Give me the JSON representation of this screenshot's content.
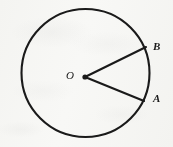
{
  "figure": {
    "kind": "geometry-diagram",
    "background_color": "#fbfbfa",
    "ink_color": "#1a1a1a",
    "canvas": {
      "width": 173,
      "height": 147
    },
    "circle": {
      "name": "main-circle",
      "center_x": 85.5,
      "center_y": 73,
      "radius": 64,
      "stroke_width": 2.1,
      "fill": "none"
    },
    "center_point": {
      "name": "center-point-O",
      "x": 85,
      "y": 77,
      "radius": 2.6
    },
    "radii": [
      {
        "name": "radius-OB",
        "from_label": "O",
        "to_label": "B",
        "x1": 85,
        "y1": 77,
        "x2": 146,
        "y2": 47,
        "stroke_width": 2.1
      },
      {
        "name": "radius-OA",
        "from_label": "O",
        "to_label": "A",
        "x1": 85,
        "y1": 77,
        "x2": 144,
        "y2": 101,
        "stroke_width": 2.1
      }
    ],
    "labels": {
      "center": "O",
      "upper_point": "B",
      "lower_point": "A"
    }
  }
}
